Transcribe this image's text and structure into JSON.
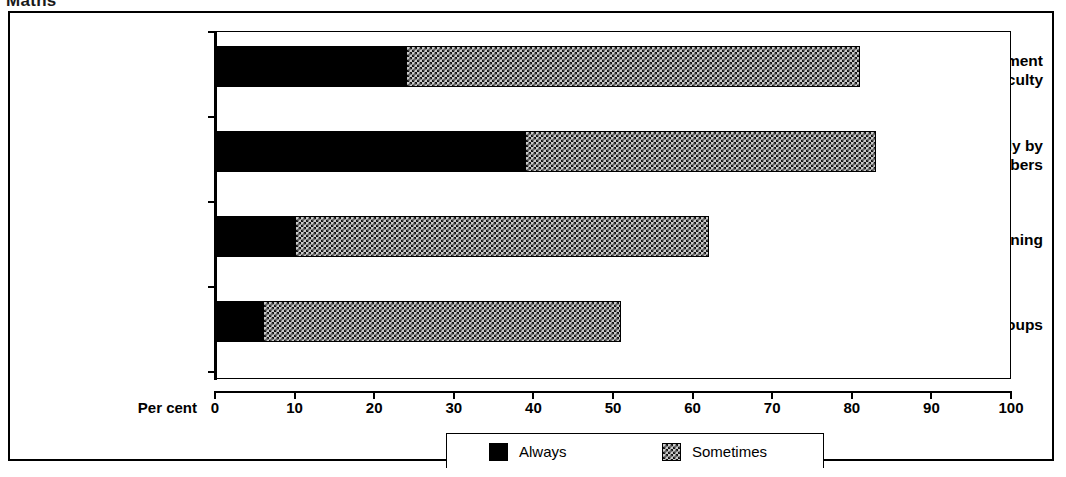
{
  "figure": {
    "heading_clipped": "Maths"
  },
  "chart_data": {
    "type": "bar",
    "orientation": "horizontal",
    "stacked": true,
    "title": "Maths",
    "xlabel": "Per cent",
    "ylabel": "",
    "xlim": [
      0,
      100
    ],
    "xticks": [
      0,
      10,
      20,
      30,
      40,
      50,
      60,
      70,
      80,
      90,
      100
    ],
    "xtick_labels": [
      "0",
      "10",
      "20",
      "30",
      "40",
      "50",
      "60",
      "70",
      "80",
      "90",
      "100"
    ],
    "grid": false,
    "legend_position": "bottom-center",
    "categories": [
      "As a whole department\nor faculty",
      "Individually by\nstaff members",
      "HOD does the planning",
      "In small topic groups"
    ],
    "series": [
      {
        "name": "Always",
        "values": [
          24,
          39,
          10,
          6
        ]
      },
      {
        "name": "Sometimes",
        "values": [
          57,
          44,
          52,
          45
        ]
      }
    ],
    "cumulative_ends": [
      81,
      83,
      62,
      51
    ],
    "colors": {
      "always": "#000000",
      "sometimes_fill": "#c9c9c9",
      "sometimes_hatch": "#141414",
      "axis": "#000000",
      "background": "#ffffff"
    }
  },
  "axis": {
    "x_title": "Per cent"
  },
  "legend": {
    "entries": [
      {
        "label": "Always",
        "swatch": "solid-black-swatch"
      },
      {
        "label": "Sometimes",
        "swatch": "checkered-grey-swatch"
      }
    ]
  }
}
